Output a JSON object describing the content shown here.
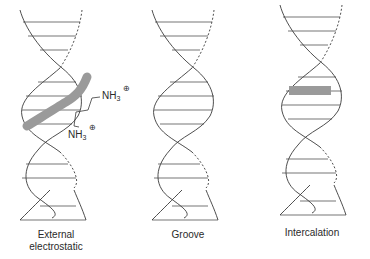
{
  "panels": [
    {
      "id": "external",
      "label_line1": "External",
      "label_line2": "electrostatic"
    },
    {
      "id": "groove",
      "label_line1": "Groove"
    },
    {
      "id": "intercalation",
      "label_line1": "Intercalation"
    }
  ],
  "molecule": {
    "top_group": "NH",
    "bottom_group": "NH",
    "subscript": "3",
    "charge": "+"
  },
  "colors": {
    "strand": "#3a3a3a",
    "ligand": "#9a9a9a",
    "background": "#ffffff"
  }
}
